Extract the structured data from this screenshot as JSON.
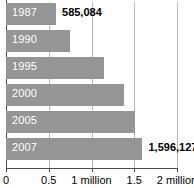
{
  "chart_data": {
    "type": "bar",
    "orientation": "horizontal",
    "title": "",
    "subtitle": "",
    "xlabel": "",
    "ylabel": "",
    "categories": [
      "1987",
      "1990",
      "1995",
      "2000",
      "2005",
      "2007"
    ],
    "values": [
      585084,
      753000,
      1151000,
      1385000,
      1514000,
      1596127
    ],
    "value_labels": [
      "585,084",
      "",
      "",
      "",
      "",
      "1,596,127"
    ],
    "xlim": [
      0,
      2000000
    ],
    "xticks": [
      0,
      500000,
      1000000,
      1500000,
      2000000
    ],
    "xtick_labels": [
      "0",
      "0.5",
      "1 million",
      "1.5",
      "2 million"
    ],
    "grid": true,
    "grid_axis": "x",
    "legend": false,
    "bar_color": "#959595",
    "grid_color": "#b9b9b9",
    "axis_color": "#4d4d4d",
    "category_label_color": "#ffffff",
    "value_label_color": "#000000"
  },
  "bars": [
    {
      "category": "1987",
      "value": 585084,
      "value_label": "585,084"
    },
    {
      "category": "1990",
      "value": 753000,
      "value_label": ""
    },
    {
      "category": "1995",
      "value": 1151000,
      "value_label": ""
    },
    {
      "category": "2000",
      "value": 1385000,
      "value_label": ""
    },
    {
      "category": "2005",
      "value": 1514000,
      "value_label": ""
    },
    {
      "category": "2007",
      "value": 1596127,
      "value_label": "1,596,127"
    }
  ],
  "axis": {
    "ticks": [
      {
        "value": 0,
        "label": "0"
      },
      {
        "value": 500000,
        "label": "0.5"
      },
      {
        "value": 1000000,
        "label": "1 million"
      },
      {
        "value": 1500000,
        "label": "1.5"
      },
      {
        "value": 2000000,
        "label": "2 million"
      }
    ]
  }
}
